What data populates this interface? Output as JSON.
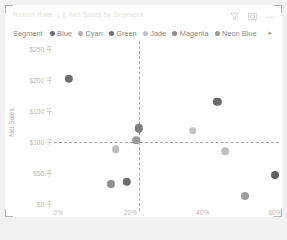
{
  "visual": {
    "title": "Return Rate ❘❙ Net Sales by Segment",
    "header_icons": [
      {
        "name": "filter-icon",
        "label": "Filters"
      },
      {
        "name": "focus-mode-icon",
        "label": "Focus mode"
      },
      {
        "name": "more-options-icon",
        "label": "More options"
      }
    ]
  },
  "legend": {
    "title": "Segment",
    "next_arrow": "▸",
    "items": [
      {
        "label": "Blue",
        "color": "#6f6f6f"
      },
      {
        "label": "Cyan",
        "color": "#b5b5b5"
      },
      {
        "label": "Green",
        "color": "#707070"
      },
      {
        "label": "Jade",
        "color": "#c0c0c0"
      },
      {
        "label": "Magenta",
        "color": "#8c8c8c"
      },
      {
        "label": "Neon Blue",
        "color": "#9a9a9a"
      }
    ]
  },
  "chart_data": {
    "type": "scatter",
    "title": "Return Rate ❘❙ Net Sales by Segment",
    "xlabel": "Return Rate",
    "ylabel": "Net Sales",
    "xlim": [
      0,
      0.6
    ],
    "ylim": [
      0,
      250
    ],
    "x_tick_labels": [
      "0%",
      "20%",
      "40%",
      "60%"
    ],
    "x_tick_values": [
      0,
      0.2,
      0.4,
      0.6
    ],
    "y_tick_labels": [
      "$0 千",
      "$50 千",
      "$100 千",
      "$150 千",
      "$200 千",
      "$250 千"
    ],
    "y_tick_values": [
      0,
      50,
      100,
      150,
      200,
      250
    ],
    "grid": false,
    "legend_position": "top",
    "reference_lines": [
      {
        "name": "average-return-rate",
        "axis": "x",
        "value": 0.225,
        "style": "dashed",
        "color": "#a9a9a9"
      },
      {
        "name": "average-net-sales",
        "axis": "y",
        "value": 100,
        "style": "dashed",
        "color": "#a9a9a9"
      }
    ],
    "points": [
      {
        "segment": "Blue",
        "x": 0.03,
        "y": 202,
        "r": 4.2,
        "color": "#6f6f6f"
      },
      {
        "segment": "Green",
        "x": 0.44,
        "y": 165,
        "r": 4.2,
        "color": "#6b6b6b"
      },
      {
        "segment": "Magenta",
        "x": 0.223,
        "y": 122,
        "r": 4.2,
        "color": "#7d7d7d"
      },
      {
        "segment": "Jade",
        "x": 0.372,
        "y": 118,
        "r": 3.8,
        "color": "#c3c3c3"
      },
      {
        "segment": "Neon Blue",
        "x": 0.216,
        "y": 103,
        "r": 3.8,
        "color": "#9b9b9b"
      },
      {
        "segment": "Cyan",
        "x": 0.16,
        "y": 88,
        "r": 3.8,
        "color": "#bdbdbd"
      },
      {
        "segment": "Jade",
        "x": 0.462,
        "y": 85,
        "r": 3.8,
        "color": "#c0c0c0"
      },
      {
        "segment": "Blue",
        "x": 0.6,
        "y": 47,
        "r": 4.0,
        "color": "#5f5f5f"
      },
      {
        "segment": "Green",
        "x": 0.19,
        "y": 36,
        "r": 4.2,
        "color": "#6d6d6d"
      },
      {
        "segment": "Magenta",
        "x": 0.147,
        "y": 33,
        "r": 4.0,
        "color": "#8f8f8f"
      },
      {
        "segment": "Neon Blue",
        "x": 0.518,
        "y": 13,
        "r": 4.0,
        "color": "#9e9e9e"
      }
    ]
  }
}
